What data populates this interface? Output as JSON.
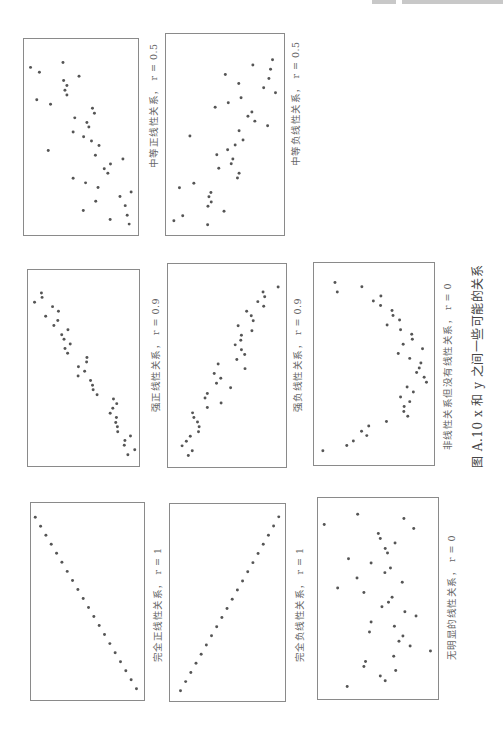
{
  "figure": {
    "caption": "图 A.10  x 和 y 之间一些可能的关系",
    "orientation": "page rotated 90° counter-clockwise",
    "dot_color": "#555555",
    "border_color": "#8a8a8a"
  },
  "chart_data": [
    {
      "id": "A",
      "type": "scatter",
      "title": "中等正线性关系， r = 0.5",
      "box": [
        23,
        38,
        116,
        198
      ],
      "size": [
        348,
        594
      ],
      "points": [
        [
          20,
          86
        ],
        [
          47,
          101
        ],
        [
          119,
          71
        ],
        [
          168,
          113
        ],
        [
          121,
          126
        ],
        [
          131,
          141
        ],
        [
          125,
          155
        ],
        [
          131,
          170
        ],
        [
          39,
          184
        ],
        [
          81,
          198
        ],
        [
          209,
          210
        ],
        [
          215,
          225
        ],
        [
          155,
          239
        ],
        [
          192,
          253
        ],
        [
          198,
          267
        ],
        [
          150,
          282
        ],
        [
          182,
          296
        ],
        [
          206,
          309
        ],
        [
          229,
          323
        ],
        [
          74,
          338
        ],
        [
          218,
          352
        ],
        [
          302,
          364
        ],
        [
          264,
          379
        ],
        [
          245,
          393
        ],
        [
          256,
          407
        ],
        [
          150,
          422
        ],
        [
          188,
          436
        ],
        [
          226,
          450
        ],
        [
          327,
          464
        ],
        [
          293,
          477
        ],
        [
          219,
          492
        ],
        [
          309,
          505
        ],
        [
          181,
          520
        ],
        [
          315,
          534
        ],
        [
          263,
          547
        ],
        [
          321,
          561
        ]
      ],
      "label_pos": [
        146,
        168
      ]
    },
    {
      "id": "B",
      "type": "scatter",
      "title": "中等负线性关系， r = 0.5",
      "box": [
        165,
        33,
        120,
        203
      ],
      "size": [
        360,
        609
      ],
      "points": [
        [
          325,
          78
        ],
        [
          265,
          94
        ],
        [
          319,
          107
        ],
        [
          181,
          123
        ],
        [
          314,
          135
        ],
        [
          222,
          150
        ],
        [
          298,
          163
        ],
        [
          334,
          178
        ],
        [
          229,
          193
        ],
        [
          190,
          208
        ],
        [
          150,
          222
        ],
        [
          262,
          236
        ],
        [
          250,
          249
        ],
        [
          271,
          264
        ],
        [
          310,
          278
        ],
        [
          223,
          293
        ],
        [
          73,
          309
        ],
        [
          235,
          321
        ],
        [
          211,
          336
        ],
        [
          188,
          351
        ],
        [
          155,
          366
        ],
        [
          204,
          379
        ],
        [
          199,
          393
        ],
        [
          161,
          407
        ],
        [
          223,
          422
        ],
        [
          218,
          436
        ],
        [
          85,
          452
        ],
        [
          41,
          466
        ],
        [
          137,
          480
        ],
        [
          131,
          493
        ],
        [
          138,
          509
        ],
        [
          128,
          522
        ],
        [
          177,
          537
        ],
        [
          51,
          551
        ],
        [
          24,
          566
        ],
        [
          127,
          578
        ]
      ],
      "label_pos": [
        288,
        166
      ]
    },
    {
      "id": "C",
      "type": "scatter",
      "title": "强正线性关系， r = 0.9",
      "box": [
        27,
        269,
        113,
        198
      ],
      "size": [
        339,
        594
      ],
      "points": [
        [
          41,
          70
        ],
        [
          43,
          83
        ],
        [
          20,
          98
        ],
        [
          75,
          111
        ],
        [
          93,
          125
        ],
        [
          54,
          140
        ],
        [
          91,
          153
        ],
        [
          79,
          168
        ],
        [
          122,
          181
        ],
        [
          103,
          196
        ],
        [
          110,
          210
        ],
        [
          129,
          224
        ],
        [
          113,
          238
        ],
        [
          121,
          252
        ],
        [
          180,
          265
        ],
        [
          179,
          279
        ],
        [
          154,
          293
        ],
        [
          173,
          307
        ],
        [
          153,
          321
        ],
        [
          191,
          335
        ],
        [
          197,
          349
        ],
        [
          199,
          363
        ],
        [
          211,
          378
        ],
        [
          261,
          391
        ],
        [
          271,
          405
        ],
        [
          259,
          419
        ],
        [
          251,
          434
        ],
        [
          270,
          447
        ],
        [
          268,
          462
        ],
        [
          273,
          475
        ],
        [
          274,
          490
        ],
        [
          313,
          503
        ],
        [
          296,
          517
        ],
        [
          294,
          531
        ],
        [
          326,
          545
        ],
        [
          305,
          560
        ]
      ],
      "label_pos": [
        148,
        412
      ]
    },
    {
      "id": "D",
      "type": "scatter",
      "title": "强负线性关系， r = 0.9",
      "box": [
        167,
        263,
        120,
        205
      ],
      "size": [
        360,
        615
      ],
      "points": [
        [
          336,
          70
        ],
        [
          290,
          85
        ],
        [
          295,
          99
        ],
        [
          274,
          114
        ],
        [
          292,
          128
        ],
        [
          240,
          143
        ],
        [
          254,
          157
        ],
        [
          260,
          172
        ],
        [
          214,
          187
        ],
        [
          256,
          202
        ],
        [
          224,
          216
        ],
        [
          222,
          231
        ],
        [
          205,
          245
        ],
        [
          224,
          260
        ],
        [
          234,
          274
        ],
        [
          210,
          289
        ],
        [
          153,
          303
        ],
        [
          235,
          317
        ],
        [
          141,
          332
        ],
        [
          161,
          346
        ],
        [
          148,
          361
        ],
        [
          191,
          375
        ],
        [
          120,
          392
        ],
        [
          113,
          406
        ],
        [
          162,
          421
        ],
        [
          120,
          435
        ],
        [
          75,
          451
        ],
        [
          79,
          465
        ],
        [
          90,
          479
        ],
        [
          95,
          493
        ],
        [
          93,
          508
        ],
        [
          68,
          522
        ],
        [
          56,
          537
        ],
        [
          43,
          551
        ],
        [
          74,
          566
        ],
        [
          62,
          580
        ]
      ],
      "label_pos": [
        290,
        412
      ]
    },
    {
      "id": "E",
      "type": "scatter",
      "title": "非线性关系但没有线性关系， r = 0",
      "box": [
        313,
        262,
        122,
        204
      ],
      "size": [
        366,
        612
      ],
      "points": [
        [
          64,
          59
        ],
        [
          71,
          88
        ],
        [
          146,
          72
        ],
        [
          204,
          100
        ],
        [
          181,
          115
        ],
        [
          203,
          129
        ],
        [
          238,
          144
        ],
        [
          241,
          159
        ],
        [
          261,
          173
        ],
        [
          223,
          188
        ],
        [
          264,
          202
        ],
        [
          298,
          216
        ],
        [
          300,
          231
        ],
        [
          272,
          246
        ],
        [
          331,
          260
        ],
        [
          257,
          274
        ],
        [
          292,
          289
        ],
        [
          326,
          303
        ],
        [
          321,
          318
        ],
        [
          313,
          332
        ],
        [
          336,
          346
        ],
        [
          343,
          361
        ],
        [
          284,
          376
        ],
        [
          303,
          391
        ],
        [
          264,
          406
        ],
        [
          292,
          420
        ],
        [
          275,
          435
        ],
        [
          274,
          450
        ],
        [
          286,
          464
        ],
        [
          221,
          480
        ],
        [
          167,
          494
        ],
        [
          145,
          510
        ],
        [
          161,
          523
        ],
        [
          120,
          539
        ],
        [
          100,
          553
        ],
        [
          27,
          569
        ]
      ],
      "label_pos": [
        440,
        450
      ]
    },
    {
      "id": "F",
      "type": "scatter",
      "title": "完全正线性关系， r = 1",
      "box": [
        30,
        502,
        115,
        199
      ],
      "size": [
        345,
        597
      ],
      "line": {
        "from": [
          13,
          43
        ],
        "to": [
          322,
          563
        ],
        "n": 20
      },
      "label_pos": [
        150,
        662
      ]
    },
    {
      "id": "G",
      "type": "scatter",
      "title": "完全负线性关系， r = 1",
      "box": [
        169,
        503,
        117,
        199
      ],
      "size": [
        351,
        597
      ],
      "line": {
        "from": [
          32,
          566
        ],
        "to": [
          332,
          39
        ],
        "n": 20
      },
      "label_pos": [
        292,
        662
      ]
    },
    {
      "id": "H",
      "type": "scatter",
      "title": "无明显的线性关系， r = 0",
      "box": [
        317,
        497,
        122,
        203
      ],
      "size": [
        366,
        606
      ],
      "points": [
        [
          19,
          80
        ],
        [
          121,
          49
        ],
        [
          262,
          62
        ],
        [
          292,
          92
        ],
        [
          184,
          107
        ],
        [
          190,
          122
        ],
        [
          235,
          136
        ],
        [
          205,
          152
        ],
        [
          212,
          166
        ],
        [
          93,
          183
        ],
        [
          162,
          196
        ],
        [
          221,
          211
        ],
        [
          204,
          225
        ],
        [
          119,
          241
        ],
        [
          257,
          254
        ],
        [
          60,
          271
        ],
        [
          140,
          285
        ],
        [
          226,
          299
        ],
        [
          215,
          314
        ],
        [
          195,
          328
        ],
        [
          265,
          343
        ],
        [
          299,
          356
        ],
        [
          162,
          374
        ],
        [
          233,
          387
        ],
        [
          157,
          404
        ],
        [
          259,
          416
        ],
        [
          247,
          432
        ],
        [
          281,
          446
        ],
        [
          343,
          461
        ],
        [
          231,
          477
        ],
        [
          145,
          493
        ],
        [
          140,
          508
        ],
        [
          237,
          520
        ],
        [
          190,
          537
        ],
        [
          205,
          551
        ],
        [
          89,
          568
        ]
      ],
      "label_pos": [
        444,
        660
      ]
    }
  ],
  "caption_pos": [
    468,
    468
  ]
}
